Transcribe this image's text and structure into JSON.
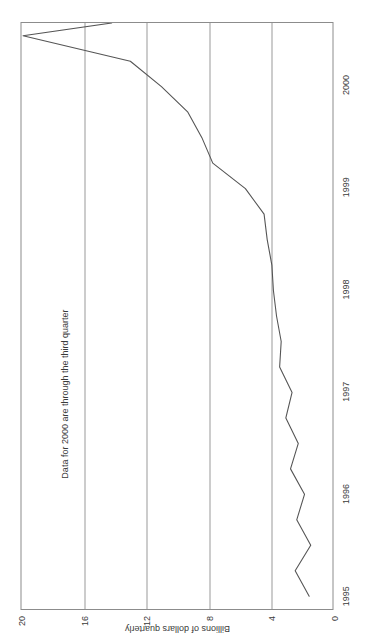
{
  "chart_data": {
    "type": "line",
    "title": "",
    "subtitle": "",
    "xlabel": "",
    "ylabel": "Billions of dollars quarterly",
    "annotation": "Data for 2000 are through the third quarter",
    "orientation": "rotated-90-ccw",
    "grid": true,
    "legend": false,
    "legend_position": "none",
    "xlim": [
      1994.875,
      2000.625
    ],
    "ylim": [
      0,
      20
    ],
    "yticks": [
      20,
      16,
      12,
      8,
      4,
      0
    ],
    "ytick_labels": [
      "20",
      "16",
      "12",
      "8",
      "4",
      "0"
    ],
    "xticks": [
      1995,
      1996,
      1997,
      1998,
      1999,
      2000
    ],
    "xtick_labels": [
      "1995",
      "1996",
      "1997",
      "1998",
      "1999",
      "2000"
    ],
    "series": [
      {
        "name": "Billions of dollars quarterly",
        "color": "#555555",
        "x": [
          1995.0,
          1995.25,
          1995.5,
          1995.75,
          1996.0,
          1996.25,
          1996.5,
          1996.75,
          1997.0,
          1997.25,
          1997.5,
          1997.75,
          1998.0,
          1998.25,
          1998.5,
          1998.75,
          1999.0,
          1999.25,
          1999.5,
          1999.75,
          2000.0,
          2000.25,
          2000.5
        ],
        "values": [
          1.5,
          2.4,
          1.4,
          2.3,
          1.8,
          2.7,
          2.2,
          3.0,
          2.6,
          3.4,
          3.3,
          3.6,
          3.8,
          3.9,
          4.2,
          4.4,
          5.6,
          7.7,
          8.4,
          9.3,
          11.0,
          13.0,
          19.9
        ]
      }
    ],
    "endpoint_value": 14.2
  },
  "axes": {
    "yticks": [
      {
        "label": "20",
        "value": 20
      },
      {
        "label": "16",
        "value": 16
      },
      {
        "label": "12",
        "value": 12
      },
      {
        "label": "8",
        "value": 8
      },
      {
        "label": "4",
        "value": 4
      },
      {
        "label": "0",
        "value": 0
      }
    ],
    "xticks": [
      {
        "label": "1995",
        "value": 1995
      },
      {
        "label": "1996",
        "value": 1996
      },
      {
        "label": "1997",
        "value": 1997
      },
      {
        "label": "1998",
        "value": 1998
      },
      {
        "label": "1999",
        "value": 1999
      },
      {
        "label": "2000",
        "value": 2000
      }
    ],
    "y_title": "Billions of dollars quarterly"
  },
  "annotation": {
    "text": "Data for 2000 are through the third quarter"
  },
  "colors": {
    "line": "#555555",
    "grid": "#9a9a9a",
    "frame": "#8c8c8c",
    "text": "#3a3a3a",
    "background": "#ffffff"
  }
}
